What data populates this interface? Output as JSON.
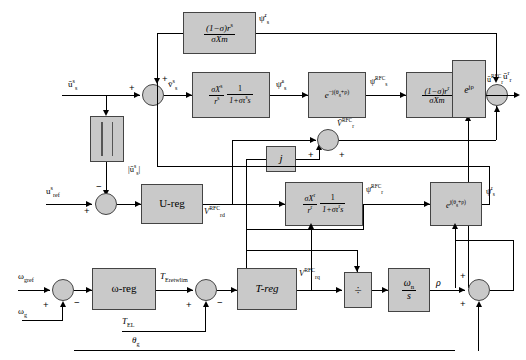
{
  "diagram": {
    "type": "control-block-diagram",
    "width": 526,
    "height": 360,
    "colors": {
      "block_fill": "#c9c9c9",
      "block_stroke": "#444444",
      "line": "#000000",
      "background": "#ffffff"
    }
  },
  "blocks": {
    "stator_coupling": {
      "num": "(1−σ)r",
      "num_sup": "s",
      "den": "σXm",
      "name": "stator-coupling-gain"
    },
    "stator_tf": {
      "gain_num": "σX",
      "gain_num_sup": "s",
      "gain_den": "r",
      "gain_den_sup": "s",
      "frac_num": "1",
      "frac_den": "1+στ",
      "frac_den_sup": "s",
      "frac_den_tail": "s"
    },
    "exp_neg": {
      "label": "e",
      "exponent": "−j(θ",
      "exponent_sub": "g",
      "exponent_tail": "+ρ)"
    },
    "rotor_coupling": {
      "num": "(1−σ)r",
      "num_sup": "r",
      "den": "σXm",
      "name": "rotor-coupling-gain"
    },
    "exp_rho": {
      "label": "e",
      "exponent": "jρ"
    },
    "abs_block": {
      "name": "absolute-value-block",
      "glyph": "| |"
    },
    "u_reg": {
      "label": "U-reg"
    },
    "j_block": {
      "label": "j"
    },
    "rotor_tf": {
      "gain_num": "σX",
      "gain_num_sup": "r",
      "gain_den": "r",
      "gain_den_sup": "r",
      "frac_num": "1",
      "frac_den": "1+στ",
      "frac_den_sup": "r",
      "frac_den_tail": "s"
    },
    "exp_pos": {
      "label": "e",
      "exponent": "j(θ",
      "exponent_sub": "g",
      "exponent_tail": "+ρ)"
    },
    "omega_reg": {
      "label": "ω-reg"
    },
    "t_reg": {
      "label": "T-reg"
    },
    "divide": {
      "label": "÷"
    },
    "integrator": {
      "num": "ω",
      "num_sub": "n",
      "den": "s"
    }
  },
  "signals": {
    "u_s_s": {
      "text": "ū",
      "sup": "s",
      "sub": "s",
      "desc": "stator voltage vector stator frame"
    },
    "psi_s_r_top": {
      "text": "ψ̄",
      "sup": "r",
      "sub": "s",
      "desc": "stator flux rotor frame"
    },
    "v_s_s": {
      "text": "v̄",
      "sup": "s",
      "sub": "s"
    },
    "psi_s_s": {
      "text": "ψ̄",
      "sup": "s",
      "sub": "s"
    },
    "psi_s_rfc": {
      "text": "ψ̄",
      "sup": "RFC",
      "sub": "s"
    },
    "u_r_rfc": {
      "text": "ū",
      "sup": "RFC",
      "sub": "r"
    },
    "u_r_r": {
      "text": "ū",
      "sup": "r",
      "sub": "r"
    },
    "abs_u_s_s": {
      "text": "|ū",
      "sup": "s",
      "sub": "s",
      "tail": "|"
    },
    "u_ref_s": {
      "text": "u",
      "sup": "s",
      "sub": "ref"
    },
    "v_rd_rfc": {
      "text": "V",
      "sup": "RFC",
      "sub": "rd"
    },
    "v_r_rfc": {
      "text": "V̄",
      "sup": "RFC",
      "sub": "r"
    },
    "psi_r_rfc": {
      "text": "ψ̄",
      "sup": "RFC",
      "sub": "r"
    },
    "psi_s_r_right": {
      "text": "ψ̄",
      "sup": "r",
      "sub": "s"
    },
    "omega_gref": {
      "text": "ω",
      "sub": "gref"
    },
    "omega_g": {
      "text": "ω",
      "sub": "g"
    },
    "t_eretwlim": {
      "text": "T",
      "sub": "Eretwlim"
    },
    "t_el": {
      "text": "T",
      "sub": "EL"
    },
    "theta_g": {
      "text": "θ",
      "sub": "g"
    },
    "v_rq_rfc": {
      "text": "V",
      "sup": "RFC",
      "sub": "rq"
    },
    "rho": {
      "text": "ρ"
    }
  },
  "sum_junctions": [
    {
      "name": "v-s-summer",
      "inputs": [
        "+",
        "+"
      ]
    },
    {
      "name": "u-error-summer",
      "inputs": [
        "+",
        "−"
      ]
    },
    {
      "name": "v-r-rfc-summer",
      "inputs": [
        "+",
        "+"
      ]
    },
    {
      "name": "u-r-rfc-summer",
      "inputs": [
        "−",
        "+"
      ]
    },
    {
      "name": "speed-error-summer",
      "inputs": [
        "+",
        "−"
      ]
    },
    {
      "name": "torque-error-summer",
      "inputs": [
        "+",
        "−"
      ]
    },
    {
      "name": "angle-summer",
      "inputs": [
        "+",
        "+"
      ]
    }
  ]
}
